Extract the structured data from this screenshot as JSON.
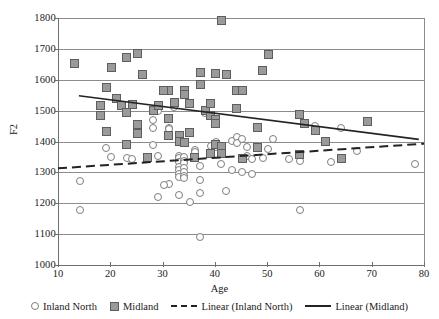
{
  "chart_data": {
    "type": "scatter",
    "title": "",
    "xlabel": "Age",
    "ylabel": "F2",
    "xlim": [
      10,
      80
    ],
    "ylim": [
      1000,
      1800
    ],
    "xticks": [
      "10",
      "20",
      "30",
      "40",
      "50",
      "60",
      "70",
      "80"
    ],
    "yticks": [
      "1000",
      "1100",
      "1200",
      "1300",
      "1400",
      "1500",
      "1600",
      "1700",
      "1800"
    ],
    "grid": "horizontal",
    "legend_position": "bottom",
    "series": [
      {
        "name": "Inland North",
        "marker": "open-circle",
        "color": "#ffffff",
        "edge_color": "#7d7d7d",
        "points": [
          [
            14,
            1276
          ],
          [
            14,
            1182
          ],
          [
            19,
            1382
          ],
          [
            20,
            1352
          ],
          [
            23,
            1350
          ],
          [
            24,
            1345
          ],
          [
            28,
            1473
          ],
          [
            28,
            1447
          ],
          [
            28,
            1393
          ],
          [
            29,
            1503
          ],
          [
            29,
            1357
          ],
          [
            31,
            1447
          ],
          [
            31,
            1444
          ],
          [
            31,
            1265
          ],
          [
            30,
            1262
          ],
          [
            29,
            1224
          ],
          [
            32,
            1515
          ],
          [
            33,
            1357
          ],
          [
            33,
            1350
          ],
          [
            33,
            1338
          ],
          [
            33,
            1322
          ],
          [
            33,
            1311
          ],
          [
            33,
            1299
          ],
          [
            33,
            1288
          ],
          [
            33,
            1230
          ],
          [
            34,
            1352
          ],
          [
            34,
            1340
          ],
          [
            34,
            1333
          ],
          [
            34,
            1318
          ],
          [
            34,
            1305
          ],
          [
            34,
            1290
          ],
          [
            34,
            1284
          ],
          [
            35,
            1207
          ],
          [
            36,
            1375
          ],
          [
            36,
            1368
          ],
          [
            37,
            1325
          ],
          [
            37,
            1094
          ],
          [
            37,
            1280
          ],
          [
            37,
            1237
          ],
          [
            38,
            1494
          ],
          [
            39,
            1390
          ],
          [
            40,
            1403
          ],
          [
            40,
            1387
          ],
          [
            41,
            1377
          ],
          [
            41,
            1330
          ],
          [
            42,
            1243
          ],
          [
            43,
            1406
          ],
          [
            43,
            1310
          ],
          [
            44,
            1418
          ],
          [
            44,
            1400
          ],
          [
            45,
            1412
          ],
          [
            45,
            1305
          ],
          [
            46,
            1385
          ],
          [
            46,
            1356
          ],
          [
            47,
            1347
          ],
          [
            47,
            1297
          ],
          [
            49,
            1350
          ],
          [
            50,
            1379
          ],
          [
            51,
            1411
          ],
          [
            54,
            1348
          ],
          [
            56,
            1340
          ],
          [
            56,
            1182
          ],
          [
            59,
            1454
          ],
          [
            62,
            1337
          ],
          [
            64,
            1448
          ],
          [
            67,
            1371
          ],
          [
            78,
            1331
          ]
        ]
      },
      {
        "name": "Midland",
        "marker": "filled-square",
        "color": "#9a9a9a",
        "edge_color": "#5e5e5e",
        "points": [
          [
            13,
            1657
          ],
          [
            18,
            1519
          ],
          [
            18,
            1489
          ],
          [
            19,
            1577
          ],
          [
            19,
            1435
          ],
          [
            20,
            1642
          ],
          [
            21,
            1541
          ],
          [
            22,
            1520
          ],
          [
            23,
            1675
          ],
          [
            23,
            1497
          ],
          [
            23,
            1392
          ],
          [
            24,
            1523
          ],
          [
            25,
            1689
          ],
          [
            25,
            1457
          ],
          [
            25,
            1429
          ],
          [
            26,
            1619
          ],
          [
            27,
            1352
          ],
          [
            28,
            1503
          ],
          [
            29,
            1521
          ],
          [
            31,
            1568
          ],
          [
            31,
            1479
          ],
          [
            31,
            1424
          ],
          [
            30,
            1568
          ],
          [
            32,
            1531
          ],
          [
            33,
            1422
          ],
          [
            33,
            1404
          ],
          [
            34,
            1570
          ],
          [
            34,
            1556
          ],
          [
            34,
            1399
          ],
          [
            35,
            1526
          ],
          [
            35,
            1432
          ],
          [
            36,
            1350
          ],
          [
            37,
            1628
          ],
          [
            37,
            1587
          ],
          [
            38,
            1503
          ],
          [
            39,
            1525
          ],
          [
            39,
            1489
          ],
          [
            39,
            1363
          ],
          [
            40,
            1624
          ],
          [
            40,
            1473
          ],
          [
            40,
            1461
          ],
          [
            40,
            1392
          ],
          [
            41,
            1795
          ],
          [
            41,
            1387
          ],
          [
            41,
            1365
          ],
          [
            42,
            1621
          ],
          [
            44,
            1568
          ],
          [
            44,
            1511
          ],
          [
            45,
            1568
          ],
          [
            45,
            1348
          ],
          [
            48,
            1447
          ],
          [
            48,
            1383
          ],
          [
            49,
            1632
          ],
          [
            50,
            1686
          ],
          [
            56,
            1492
          ],
          [
            56,
            1362
          ],
          [
            57,
            1461
          ],
          [
            59,
            1438
          ],
          [
            61,
            1404
          ],
          [
            64,
            1348
          ],
          [
            69,
            1468
          ]
        ]
      }
    ],
    "trendlines": [
      {
        "name": "Linear (Inland North)",
        "style": "dashed",
        "color": "#232323",
        "x_start": 10,
        "y_start": 1313,
        "x_end": 80,
        "y_end": 1393
      },
      {
        "name": "Linear (Midland)",
        "style": "solid",
        "color": "#232323",
        "x_start": 14,
        "y_start": 1548,
        "x_end": 79,
        "y_end": 1407
      }
    ]
  },
  "legend": {
    "items": [
      {
        "label": "Inland North",
        "marker": "open-circle"
      },
      {
        "label": "Midland",
        "marker": "filled-square"
      },
      {
        "label": "Linear (Inland North)",
        "marker": "dashed-line"
      },
      {
        "label": "Linear (Midland)",
        "marker": "solid-line"
      }
    ]
  }
}
